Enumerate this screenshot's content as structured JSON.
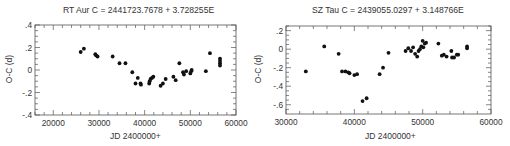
{
  "chart_data": [
    {
      "type": "scatter",
      "title": "RT Aur  C = 2441723.7678 + 3.728255E",
      "xlabel": "JD 2400000+",
      "ylabel": "O-C (d)",
      "xlim": [
        16000,
        60000
      ],
      "ylim": [
        -0.4,
        0.4
      ],
      "xticks": [
        20000,
        30000,
        40000,
        50000,
        60000
      ],
      "xtick_labels": [
        "20000",
        "30000",
        "40000",
        "50000",
        "60000"
      ],
      "yticks": [
        0.4,
        0.2,
        0,
        -0.2,
        -0.4
      ],
      "ytick_labels": [
        ".4",
        ".2",
        "0",
        "-.2",
        "-.4"
      ],
      "grid": false,
      "legend": null,
      "points": [
        {
          "x": 26000,
          "y": 0.16
        },
        {
          "x": 26700,
          "y": 0.19
        },
        {
          "x": 29200,
          "y": 0.14
        },
        {
          "x": 29400,
          "y": 0.13
        },
        {
          "x": 29700,
          "y": 0.12
        },
        {
          "x": 33000,
          "y": 0.12
        },
        {
          "x": 34500,
          "y": 0.06
        },
        {
          "x": 35800,
          "y": 0.06
        },
        {
          "x": 37300,
          "y": -0.02
        },
        {
          "x": 38000,
          "y": -0.12
        },
        {
          "x": 38500,
          "y": -0.07
        },
        {
          "x": 39100,
          "y": -0.12
        },
        {
          "x": 39200,
          "y": -0.13
        },
        {
          "x": 41000,
          "y": -0.12
        },
        {
          "x": 41100,
          "y": -0.1
        },
        {
          "x": 41300,
          "y": -0.08
        },
        {
          "x": 41600,
          "y": -0.07
        },
        {
          "x": 41900,
          "y": -0.06
        },
        {
          "x": 43500,
          "y": -0.14
        },
        {
          "x": 44000,
          "y": -0.12
        },
        {
          "x": 44600,
          "y": -0.08
        },
        {
          "x": 46300,
          "y": -0.06
        },
        {
          "x": 46800,
          "y": -0.09
        },
        {
          "x": 47600,
          "y": 0.06
        },
        {
          "x": 48400,
          "y": -0.02
        },
        {
          "x": 48600,
          "y": -0.04
        },
        {
          "x": 49100,
          "y": -0.01
        },
        {
          "x": 50000,
          "y": -0.03
        },
        {
          "x": 50200,
          "y": -0.01
        },
        {
          "x": 50300,
          "y": 0.0
        },
        {
          "x": 53400,
          "y": -0.01
        },
        {
          "x": 54300,
          "y": 0.15
        },
        {
          "x": 56500,
          "y": 0.1
        },
        {
          "x": 56500,
          "y": 0.08
        },
        {
          "x": 56500,
          "y": 0.06
        },
        {
          "x": 56500,
          "y": 0.04
        }
      ]
    },
    {
      "type": "scatter",
      "title": "SZ Tau  C = 2439055.0297 + 3.148766E",
      "xlabel": "JD 2400000+",
      "ylabel": "O-C (d)",
      "xlim": [
        30000,
        60000
      ],
      "ylim": [
        -0.7,
        0.25
      ],
      "xticks": [
        30000,
        40000,
        50000,
        60000
      ],
      "xtick_labels": [
        "30000",
        "40000",
        "50000",
        "60000"
      ],
      "yticks": [
        0.2,
        0,
        -0.2,
        -0.4,
        -0.6
      ],
      "ytick_labels": [
        ".2",
        "0",
        "-.2",
        "-.4",
        "-.6"
      ],
      "grid": false,
      "legend": null,
      "points": [
        {
          "x": 32900,
          "y": -0.24
        },
        {
          "x": 35600,
          "y": 0.03
        },
        {
          "x": 37700,
          "y": -0.05
        },
        {
          "x": 38200,
          "y": -0.24
        },
        {
          "x": 38700,
          "y": -0.24
        },
        {
          "x": 39100,
          "y": -0.25
        },
        {
          "x": 39300,
          "y": -0.26
        },
        {
          "x": 40000,
          "y": -0.28
        },
        {
          "x": 40400,
          "y": -0.27
        },
        {
          "x": 41200,
          "y": -0.56
        },
        {
          "x": 41800,
          "y": -0.53
        },
        {
          "x": 43700,
          "y": -0.27
        },
        {
          "x": 44200,
          "y": -0.2
        },
        {
          "x": 45000,
          "y": -0.04
        },
        {
          "x": 47500,
          "y": -0.02
        },
        {
          "x": 47900,
          "y": 0.01
        },
        {
          "x": 48300,
          "y": -0.02
        },
        {
          "x": 48600,
          "y": 0.02
        },
        {
          "x": 48900,
          "y": -0.05
        },
        {
          "x": 49200,
          "y": -0.08
        },
        {
          "x": 49400,
          "y": -0.02
        },
        {
          "x": 49600,
          "y": 0.0
        },
        {
          "x": 49800,
          "y": 0.03
        },
        {
          "x": 50000,
          "y": 0.09
        },
        {
          "x": 50100,
          "y": 0.02
        },
        {
          "x": 50300,
          "y": 0.06
        },
        {
          "x": 50500,
          "y": 0.07
        },
        {
          "x": 52300,
          "y": 0.06
        },
        {
          "x": 52800,
          "y": -0.07
        },
        {
          "x": 53100,
          "y": -0.06
        },
        {
          "x": 53500,
          "y": -0.08
        },
        {
          "x": 54200,
          "y": -0.02
        },
        {
          "x": 54300,
          "y": -0.09
        },
        {
          "x": 54600,
          "y": -0.09
        },
        {
          "x": 55000,
          "y": -0.06
        },
        {
          "x": 55200,
          "y": -0.06
        },
        {
          "x": 56500,
          "y": 0.03
        },
        {
          "x": 56500,
          "y": 0.01
        }
      ]
    }
  ],
  "charts": [
    {
      "title": "RT Aur  C = 2441723.7678 + 3.728255E",
      "xlabel": "JD 2400000+",
      "ylabel": "O-C (d)"
    },
    {
      "title": "SZ Tau  C = 2439055.0297 + 3.148766E",
      "xlabel": "JD 2400000+",
      "ylabel": "O-C (d)"
    }
  ],
  "layout": {
    "frames": [
      {
        "left": 35,
        "top": 25,
        "right": 236,
        "bottom": 115,
        "minor_x": 2000,
        "minor_y": 0.05
      },
      {
        "left": 286,
        "top": 26,
        "right": 491,
        "bottom": 114,
        "minor_x": 2000,
        "minor_y": 0.05
      }
    ]
  }
}
